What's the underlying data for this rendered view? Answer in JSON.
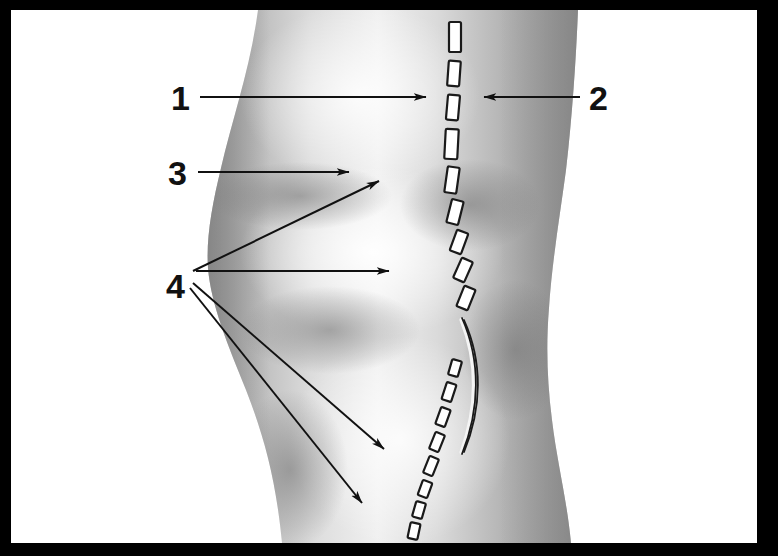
{
  "figure": {
    "type": "anatomical-illustration",
    "view": "lateral",
    "background_color": "#ffffff",
    "frame_color": "#000000",
    "skin_light": "#f2f2f2",
    "skin_mid": "#b9b9b9",
    "skin_dark": "#8a8a8a",
    "ink_color": "#111111",
    "dash_fill": "#ffffff",
    "dash_stroke": "#1a1a1a"
  },
  "frame": {
    "left": 11,
    "top": 10,
    "right": 757,
    "bottom": 543,
    "thickness": 11
  },
  "callouts": [
    {
      "id": "callout-1",
      "label": "1",
      "label_x": 171,
      "label_y": 110,
      "arrow_from_x": 200,
      "arrow_from_y": 97,
      "arrow_to_x": 426,
      "arrow_to_y": 97,
      "direction": "right",
      "target": "dashed-incision-line-upper"
    },
    {
      "id": "callout-2",
      "label": "2",
      "label_x": 589,
      "label_y": 110,
      "arrow_from_x": 580,
      "arrow_from_y": 97,
      "arrow_to_x": 484,
      "arrow_to_y": 97,
      "direction": "left",
      "target": "lateral-thigh-contour"
    },
    {
      "id": "callout-3",
      "label": "3",
      "label_x": 168,
      "label_y": 185,
      "arrow_from_x": 198,
      "arrow_from_y": 172,
      "arrow_to_x": 349,
      "arrow_to_y": 172,
      "direction": "right",
      "target": "femoral-condyle-prominence"
    },
    {
      "id": "callout-4",
      "label": "4",
      "label_x": 166,
      "label_y": 298,
      "arrows": [
        {
          "from_x": 193,
          "from_y": 271,
          "to_x": 379,
          "to_y": 181,
          "direction": "up-right",
          "target": "anterior-knee-landmark"
        },
        {
          "from_x": 196,
          "from_y": 271,
          "to_x": 389,
          "to_y": 271,
          "direction": "right",
          "target": "mid-patellar-landmark"
        },
        {
          "from_x": 193,
          "from_y": 283,
          "to_x": 384,
          "to_y": 449,
          "direction": "down-right",
          "target": "tibial-tubercle-landmark"
        },
        {
          "from_x": 190,
          "from_y": 288,
          "to_x": 362,
          "to_y": 503,
          "direction": "down-right",
          "target": "lower-leg-landmark"
        }
      ]
    }
  ],
  "incision_line": {
    "name": "dashed-incision-line",
    "style": "dashed with central solid segment",
    "dash_count_upper": 9,
    "dash_count_lower": 11,
    "solid_segment": {
      "start_y": 200,
      "end_y": 345,
      "bulge": "right"
    }
  }
}
